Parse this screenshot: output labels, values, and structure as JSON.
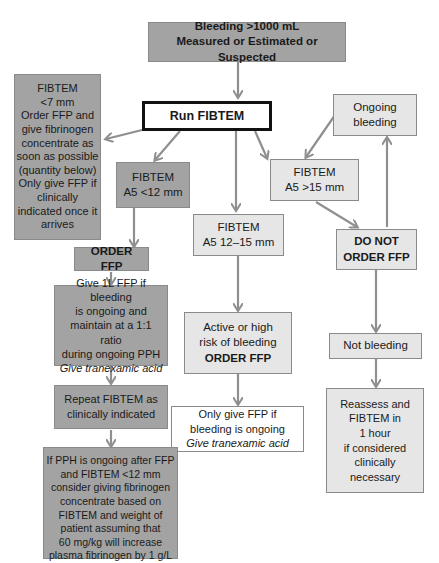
{
  "colors": {
    "dark_box": "#a3a3a3",
    "mid_box": "#c8c8c8",
    "light_box": "#e6e6e6",
    "arrow": "#8f8f8f",
    "border": "#8a8a8a"
  },
  "nodes": {
    "start": {
      "lines": [
        "Bleeding >1000 mL",
        "Measured or Estimated or Suspected"
      ]
    },
    "run_fibtem": {
      "label": "Run FIBTEM"
    },
    "fibtem_lt7": {
      "lines": [
        "FIBTEM",
        "<7 mm",
        "Order FFP and",
        "give fibrinogen",
        "concentrate as",
        "soon as possible",
        "(quantity below)",
        "Only give FFP if",
        "clinically",
        "indicated once it",
        "arrives"
      ]
    },
    "fibtem_lt12": {
      "lines": [
        "FIBTEM",
        "A5 <12 mm"
      ]
    },
    "fibtem_12_15": {
      "lines": [
        "FIBTEM",
        "A5 12–15 mm"
      ]
    },
    "fibtem_gt15": {
      "lines": [
        "FIBTEM",
        "A5 >15 mm"
      ]
    },
    "ongoing_bleeding": {
      "lines": [
        "Ongoing",
        "bleeding"
      ]
    },
    "order_ffp": {
      "label": "ORDER FFP"
    },
    "do_not_order_ffp": {
      "lines": [
        "DO NOT",
        "ORDER FFP"
      ]
    },
    "give_1l_ffp": {
      "lines": [
        "Give 1L FFP if bleeding",
        "is ongoing and",
        "maintain at a 1:1 ratio",
        "during ongoing PPH"
      ],
      "italic": "Give tranexamic acid"
    },
    "active_high_risk": {
      "lines": [
        "Active or high",
        "risk of bleeding"
      ],
      "bold": "ORDER FFP"
    },
    "not_bleeding": {
      "label": "Not bleeding"
    },
    "repeat_fibtem": {
      "lines": [
        "Repeat FIBTEM as",
        "clinically indicated"
      ]
    },
    "only_give_ffp": {
      "lines": [
        "Only give FFP if",
        "bleeding is ongoing"
      ],
      "italic": "Give tranexamic acid"
    },
    "reassess": {
      "lines": [
        "Reassess and",
        "FIBTEM in",
        "1 hour",
        "if considered",
        "clinically",
        "necessary"
      ]
    },
    "pph_ongoing": {
      "lines": [
        "If PPH is ongoing after FFP",
        "and FIBTEM <12 mm",
        "consider giving fibrinogen",
        "concentrate based on",
        "FIBTEM and weight of",
        "patient assuming that",
        "60 mg/kg will increase",
        "plasma  fibrinogen by 1 g/L"
      ]
    }
  }
}
